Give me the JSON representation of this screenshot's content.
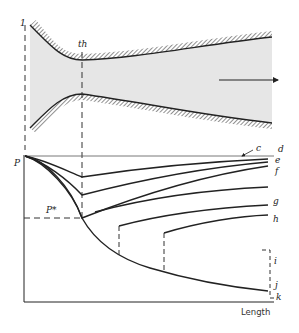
{
  "diagram": {
    "nozzle": {
      "inlet_label": "1",
      "throat_label": "th",
      "flow_direction": "arrow-right",
      "fill_color": "#e6e6e6",
      "wall_color": "#222222"
    },
    "plot": {
      "y_axis_label": "P",
      "critical_pressure_label": "P*",
      "x_axis_label": "Length",
      "curve_labels": [
        "c",
        "d",
        "e",
        "f",
        "g",
        "h",
        "i",
        "j",
        "k"
      ]
    }
  }
}
